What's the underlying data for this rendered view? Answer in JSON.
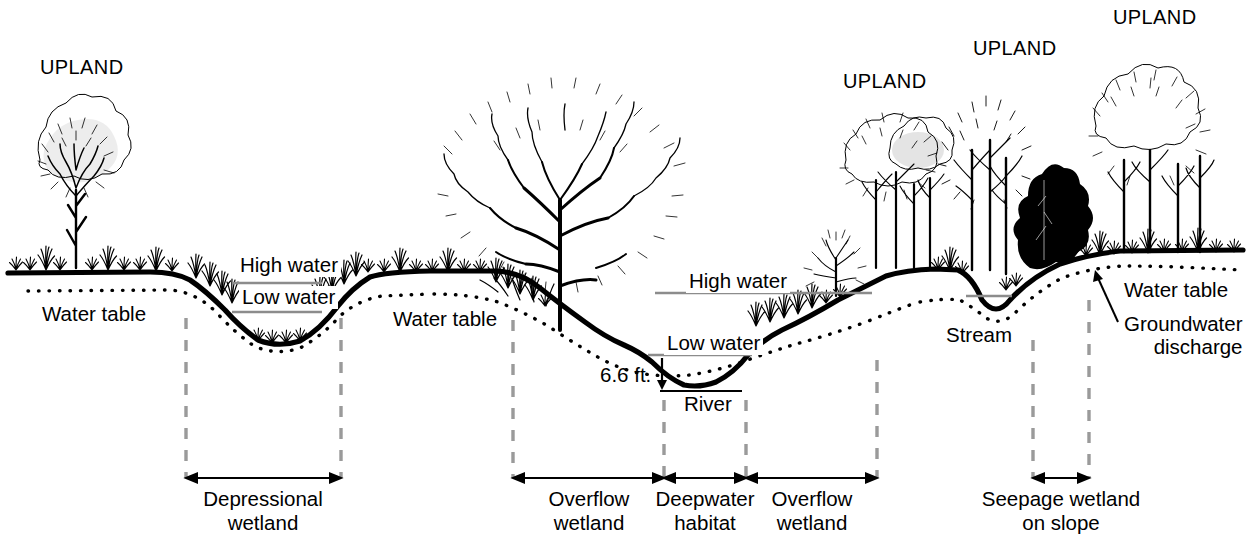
{
  "colors": {
    "ink": "#000000",
    "background": "#ffffff",
    "dashed_guide": "#9a9a9a",
    "water_line": "#8c8c8c"
  },
  "upland_labels": [
    {
      "text": "UPLAND",
      "x": 40,
      "y": 60
    },
    {
      "text": "UPLAND",
      "x": 843,
      "y": 73
    },
    {
      "text": "UPLAND",
      "x": 973,
      "y": 40
    },
    {
      "text": "UPLAND",
      "x": 1113,
      "y": 8
    }
  ],
  "water_table_labels": [
    {
      "text": "Water table",
      "x": 42,
      "y": 304
    },
    {
      "text": "Water table",
      "x": 393,
      "y": 309
    },
    {
      "text": "Water table",
      "x": 1124,
      "y": 280
    }
  ],
  "water_level_labels": [
    {
      "text": "High water",
      "x": 239,
      "y": 256
    },
    {
      "text": "Low water",
      "x": 241,
      "y": 288
    },
    {
      "text": "High water",
      "x": 688,
      "y": 272
    },
    {
      "text": "Low water",
      "x": 666,
      "y": 334
    }
  ],
  "feature_labels": [
    {
      "text": "6.6 ft.",
      "x": 601,
      "y": 366
    },
    {
      "text": "River",
      "x": 684,
      "y": 394
    },
    {
      "text": "Stream",
      "x": 946,
      "y": 325
    }
  ],
  "annotation": {
    "groundwater_discharge": {
      "line1": "Groundwater",
      "line2": "discharge",
      "x": 1124,
      "y": 314
    }
  },
  "zones": [
    {
      "name": "depressional-wetland",
      "line1": "Depressional",
      "line2": "wetland",
      "arrow_from": 188,
      "arrow_to": 339,
      "label_center": 263,
      "label_y": 487
    },
    {
      "name": "overflow-wetland-left",
      "line1": "Overflow",
      "line2": "wetland",
      "arrow_from": 516,
      "arrow_to": 661,
      "label_center": 589,
      "label_y": 487
    },
    {
      "name": "deepwater-habitat",
      "line1": "Deepwater",
      "line2": "habitat",
      "arrow_from": 668,
      "arrow_to": 743,
      "label_center": 705,
      "label_y": 487
    },
    {
      "name": "overflow-wetland-right",
      "line1": "Overflow",
      "line2": "wetland",
      "arrow_from": 750,
      "arrow_to": 874,
      "label_center": 812,
      "label_y": 487
    },
    {
      "name": "seepage-wetland-on-slope",
      "line1": "Seepage wetland",
      "line2": "on slope",
      "arrow_from": 1034,
      "arrow_to": 1088,
      "label_center": 1061,
      "label_y": 487
    }
  ],
  "guides": [
    {
      "x": 186,
      "y_top": 318,
      "y_bottom": 478
    },
    {
      "x": 341,
      "y_top": 318,
      "y_bottom": 478
    },
    {
      "x": 513,
      "y_top": 320,
      "y_bottom": 478
    },
    {
      "x": 664,
      "y_top": 400,
      "y_bottom": 478
    },
    {
      "x": 746,
      "y_top": 400,
      "y_bottom": 478
    },
    {
      "x": 877,
      "y_top": 360,
      "y_bottom": 478
    },
    {
      "x": 1033,
      "y_top": 340,
      "y_bottom": 478
    },
    {
      "x": 1089,
      "y_top": 300,
      "y_bottom": 478
    }
  ],
  "water_lines": [
    {
      "name": "high-water-depression",
      "x1": 232,
      "x2": 322,
      "y": 283
    },
    {
      "name": "low-water-depression",
      "x1": 232,
      "x2": 322,
      "y": 312
    },
    {
      "name": "high-water-river",
      "x1": 655,
      "x2": 872,
      "y": 293
    },
    {
      "name": "low-water-river",
      "x1": 648,
      "x2": 752,
      "y": 355
    },
    {
      "name": "stream-water",
      "x1": 968,
      "x2": 1012,
      "y": 296
    }
  ],
  "icons": {
    "arrow_double": "double-headed-arrow",
    "arrow_pointer": "pointer-arrow",
    "tree": "tree-icon",
    "grass": "grass-tuft-icon"
  }
}
